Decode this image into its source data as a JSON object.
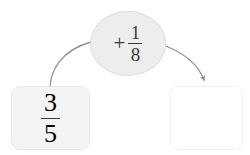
{
  "diagram": {
    "type": "function-machine",
    "background_color": "#ffffff",
    "input": {
      "label": "3/5",
      "numerator": "3",
      "denominator": "5",
      "fill_color": "#f4f4f4",
      "border_color": "#dadada"
    },
    "operator": {
      "sign": "+",
      "numerator": "1",
      "denominator": "8",
      "label": "+ 1/8",
      "fill_color": "#ededed",
      "border_color": "#c9c9c9"
    },
    "output": {
      "label": "",
      "fill_color": "#ffffff",
      "border_color": "#e2e2e2"
    },
    "connectors": [
      {
        "name": "input-to-operator",
        "from": "input-box",
        "to": "operator-oval",
        "has_arrowhead": false,
        "color": "#8f8f8f"
      },
      {
        "name": "operator-to-output",
        "from": "operator-oval",
        "to": "output-box",
        "has_arrowhead": true,
        "color": "#8f8f8f"
      }
    ]
  }
}
